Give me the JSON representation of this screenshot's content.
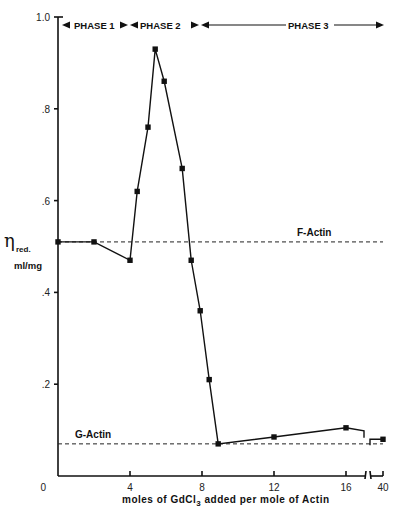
{
  "chart_data": {
    "type": "line",
    "title": "",
    "xlabel": "moles of GdCl3 added per mole of Actin",
    "ylabel": "η red. ml/mg",
    "ylabel_parts": {
      "symbol": "η",
      "subscript": "red.",
      "unit": "ml/mg"
    },
    "xlabel_parts": {
      "prefix": "moles of  GdCl",
      "subscript": "3",
      "suffix": " added  per  mole  of  Actin"
    },
    "ylim": [
      0,
      1.0
    ],
    "xlim": [
      0,
      40
    ],
    "x_axis_break": {
      "between": [
        16,
        40
      ],
      "note": "axis broken after 16; final tick is 40"
    },
    "yticks": [
      {
        "value": 0,
        "label": "0"
      },
      {
        "value": 0.2,
        "label": ".2"
      },
      {
        "value": 0.4,
        "label": ".4"
      },
      {
        "value": 0.6,
        "label": ".6"
      },
      {
        "value": 0.8,
        "label": ".8"
      },
      {
        "value": 1.0,
        "label": "1.0"
      }
    ],
    "xticks": [
      {
        "value": 4,
        "label": "4"
      },
      {
        "value": 8,
        "label": "8"
      },
      {
        "value": 12,
        "label": "12"
      },
      {
        "value": 16,
        "label": "16"
      },
      {
        "value": 40,
        "label": "40"
      }
    ],
    "grid": false,
    "legend": null,
    "series": [
      {
        "name": "Reduced viscosity",
        "marker": "square",
        "line": "solid",
        "x": [
          0,
          2,
          4,
          4.4,
          5.0,
          5.4,
          5.9,
          6.9,
          7.4,
          7.9,
          8.4,
          8.9,
          12,
          16,
          40
        ],
        "values": [
          0.51,
          0.51,
          0.47,
          0.62,
          0.76,
          0.93,
          0.86,
          0.67,
          0.47,
          0.36,
          0.21,
          0.07,
          0.085,
          0.105,
          0.08
        ]
      }
    ],
    "reference_lines": [
      {
        "label": "F-Actin",
        "y": 0.51,
        "style": "dashed"
      },
      {
        "label": "G-Actin",
        "y": 0.07,
        "style": "dashed"
      }
    ],
    "annotations": [
      {
        "label": "PHASE 1",
        "x_range": [
          0,
          4
        ]
      },
      {
        "label": "PHASE 2",
        "x_range": [
          4,
          8
        ]
      },
      {
        "label": "PHASE 3",
        "x_range": [
          8,
          40
        ]
      }
    ]
  }
}
